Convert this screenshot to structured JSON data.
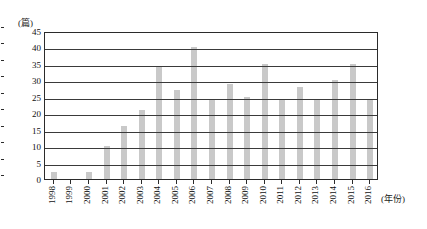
{
  "chart_data": {
    "type": "bar",
    "title": "",
    "subtitle": "",
    "xlabel": "(年份)",
    "ylabel": "(篇)",
    "ylim": [
      0,
      45
    ],
    "ytick_step": 5,
    "yticks": [
      "0",
      "5",
      "10",
      "15",
      "20",
      "25",
      "30",
      "35",
      "40",
      "45"
    ],
    "grid": true,
    "legend": "none",
    "bar_color": "#c9c9c9",
    "categories": [
      "1998",
      "1999",
      "2000",
      "2001",
      "2002",
      "2003",
      "2004",
      "2005",
      "2006",
      "2007",
      "2008",
      "2009",
      "2010",
      "2011",
      "2012",
      "2013",
      "2014",
      "2015",
      "2016"
    ],
    "values": [
      2,
      0,
      2,
      10,
      16,
      21,
      34,
      27,
      40,
      24,
      29,
      25,
      35,
      24,
      28,
      24,
      30,
      35,
      24
    ]
  }
}
